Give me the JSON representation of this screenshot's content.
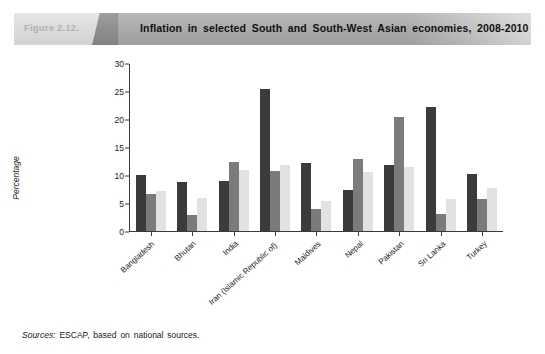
{
  "header": {
    "figure_number": "Figure 2.12.",
    "title": "Inflation in selected South and South-West Asian economies, 2008-2010"
  },
  "source_note": {
    "label": "Sources:",
    "text": "ESCAP, based on national sources."
  },
  "chart_data": {
    "type": "bar",
    "title": "Inflation in selected South and South-West Asian economies, 2008-2010",
    "xlabel": "",
    "ylabel": "Percentage",
    "ylim": [
      0,
      30
    ],
    "yticks": [
      0,
      5,
      10,
      15,
      20,
      25,
      30
    ],
    "grid": false,
    "legend_position": "bottom",
    "categories": [
      "Bangladesh",
      "Bhutan",
      "India",
      "Iran (Islamic Republic of)",
      "Maldives",
      "Nepal",
      "Pakistan",
      "Sri Lanka",
      "Turkey"
    ],
    "series": [
      {
        "name": "2008",
        "color": "#3b3b3b",
        "values": [
          10.0,
          8.8,
          9.0,
          25.3,
          12.2,
          7.4,
          11.8,
          22.2,
          10.1
        ]
      },
      {
        "name": "2009",
        "color": "#7b7b7b",
        "values": [
          6.6,
          2.9,
          12.3,
          10.7,
          3.9,
          12.8,
          20.4,
          3.0,
          5.7
        ]
      },
      {
        "name": "2010",
        "color": "#e2e2e2",
        "values": [
          7.2,
          5.9,
          10.9,
          11.8,
          5.4,
          10.5,
          11.5,
          5.8,
          7.7
        ]
      }
    ]
  }
}
